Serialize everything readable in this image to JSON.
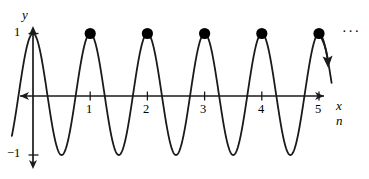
{
  "figure": {
    "background_color": "#ffffff",
    "stroke_color": "#1a1a1a",
    "marker_color": "#000000",
    "width": 369,
    "height": 179
  },
  "axes": {
    "y_axis_name": "y",
    "x_axis_name_primary": "x",
    "x_axis_name_secondary": "n",
    "y_tick_top_label": "1",
    "y_tick_bottom_label": "−1",
    "x_tick_labels": [
      "1",
      "2",
      "3",
      "4",
      "5"
    ]
  },
  "annotations": {
    "ellipsis": "···"
  },
  "chart_data": {
    "type": "line",
    "title": "",
    "subtitle": "",
    "xlabel": "x",
    "xlabel_secondary": "n",
    "ylabel": "y",
    "xlim": [
      -0.37,
      5.22
    ],
    "ylim": [
      -1.22,
      1.22
    ],
    "grid": false,
    "legend": null,
    "x_ticks": [
      1,
      2,
      3,
      4,
      5
    ],
    "x_tick_labels": [
      "1",
      "2",
      "3",
      "4",
      "5"
    ],
    "y_ticks": [
      1,
      -1
    ],
    "y_tick_labels": [
      "1",
      "−1"
    ],
    "series": [
      {
        "name": "cos(2πx)",
        "type": "line",
        "description": "Continuous cosine wave of period 1, amplitude 1, starting at a maximum at x = 0",
        "period": 1,
        "amplitude": 1,
        "x_start": -0.37,
        "x_end": 5.22,
        "key_points": [
          {
            "x": 0,
            "y": 1
          },
          {
            "x": 0.5,
            "y": -1
          },
          {
            "x": 1,
            "y": 1
          },
          {
            "x": 1.5,
            "y": -1
          },
          {
            "x": 2,
            "y": 1
          },
          {
            "x": 2.5,
            "y": -1
          },
          {
            "x": 3,
            "y": 1
          },
          {
            "x": 3.5,
            "y": -1
          },
          {
            "x": 4,
            "y": 1
          },
          {
            "x": 4.5,
            "y": -1
          },
          {
            "x": 5,
            "y": 1
          }
        ]
      },
      {
        "name": "sample points",
        "type": "scatter",
        "description": "Filled dots marking the integer samples at the wave maxima",
        "x": [
          1,
          2,
          3,
          4,
          5
        ],
        "y": [
          1,
          1,
          1,
          1,
          1
        ]
      }
    ],
    "annotations": [
      {
        "text": "···",
        "x": 5.5,
        "y": 1,
        "note": "continues to the right"
      },
      {
        "text": "",
        "type": "arrow",
        "note": "arrow leaving the last peak at x = 5 heading down and to the right"
      }
    ]
  }
}
